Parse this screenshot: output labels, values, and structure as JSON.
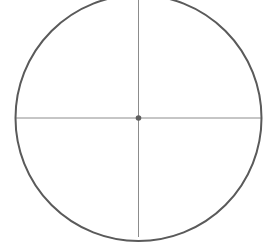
{
  "canvas": {
    "width": 268,
    "height": 243,
    "background_color": "#ffffff",
    "title": "Circle with crosshair diameters"
  },
  "colors": {
    "circle_stroke": "#5a5a5a",
    "crosshair_stroke": "#8c8c8c",
    "center_dot_fill": "#5f5f5f",
    "background": "#ffffff"
  },
  "shapes": {
    "circle": {
      "label": "circle-outline",
      "center_x": 138.5,
      "center_y": 118.0,
      "radius": 123.0,
      "stroke_width": 2.0,
      "fill": "none"
    },
    "horizontal_diameter": {
      "label": "horizontal-diameter-line",
      "x1": 15.5,
      "y1": 118.0,
      "x2": 261.5,
      "y2": 118.0,
      "stroke_width": 1.0
    },
    "vertical_diameter": {
      "label": "vertical-diameter-line",
      "x1": 138.5,
      "y1": 0.0,
      "x2": 138.5,
      "y2": 237.0,
      "stroke_width": 1.0
    },
    "center_point": {
      "label": "center-point-dot",
      "cx": 138.5,
      "cy": 118.0,
      "r": 2.8
    }
  }
}
